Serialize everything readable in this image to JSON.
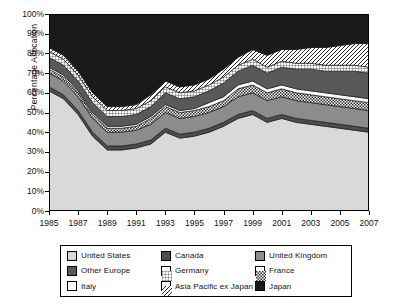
{
  "chart_data": {
    "type": "area",
    "title": "",
    "xlabel": "",
    "ylabel": "Percentage Allocation",
    "ylim": [
      0,
      100
    ],
    "xlim": [
      1985,
      2007
    ],
    "grid": false,
    "stacked": true,
    "normalized": true,
    "legend_position": "bottom",
    "ytick_labels": [
      "0%",
      "10%",
      "20%",
      "30%",
      "40%",
      "50%",
      "60%",
      "70%",
      "80%",
      "90%",
      "100%"
    ],
    "ytick_values": [
      0,
      10,
      20,
      30,
      40,
      50,
      60,
      70,
      80,
      90,
      100
    ],
    "xtick_labels": [
      "1985",
      "1987",
      "1989",
      "1991",
      "1993",
      "1995",
      "1997",
      "1999",
      "2001",
      "2003",
      "2005",
      "2007"
    ],
    "xtick_values": [
      1985,
      1987,
      1989,
      1991,
      1993,
      1995,
      1997,
      1999,
      2001,
      2003,
      2005,
      2007
    ],
    "x": [
      1985,
      1986,
      1987,
      1988,
      1989,
      1990,
      1991,
      1992,
      1993,
      1994,
      1995,
      1996,
      1997,
      1998,
      1999,
      2000,
      2001,
      2002,
      2003,
      2004,
      2005,
      2006,
      2007
    ],
    "series": [
      {
        "name": "United States",
        "fill": "#d9d9d9",
        "pattern": "solid",
        "values": [
          61,
          57,
          49,
          38,
          31,
          31,
          32,
          34,
          40,
          37,
          38,
          40,
          43,
          47,
          49,
          45,
          47,
          45,
          44,
          43,
          42,
          41,
          40
        ]
      },
      {
        "name": "Canada",
        "fill": "#4d4d4d",
        "pattern": "solid",
        "values": [
          2,
          2,
          2,
          2,
          2,
          2,
          2,
          2,
          2,
          2,
          2,
          2,
          2,
          2,
          2,
          2,
          2,
          2,
          2,
          2,
          2,
          2,
          2
        ]
      },
      {
        "name": "United Kingdom",
        "fill": "#8c8c8c",
        "pattern": "solid",
        "values": [
          7,
          7,
          7,
          7,
          7,
          7,
          7,
          8,
          8,
          8,
          8,
          8,
          8,
          9,
          9,
          9,
          9,
          9,
          9,
          9,
          9,
          9,
          9
        ]
      },
      {
        "name": "France",
        "fill": "#ffffff",
        "pattern": "checker",
        "values": [
          2,
          2,
          2,
          2,
          2,
          2,
          2,
          3,
          3,
          3,
          3,
          3,
          3,
          4,
          4,
          4,
          4,
          4,
          4,
          4,
          4,
          4,
          4
        ]
      },
      {
        "name": "Italy",
        "fill": "#ffffff",
        "pattern": "solid",
        "values": [
          1,
          1,
          1,
          1,
          1,
          1,
          1,
          1,
          1,
          1,
          1,
          2,
          2,
          2,
          2,
          2,
          2,
          2,
          2,
          2,
          2,
          2,
          2
        ]
      },
      {
        "name": "Other Europe",
        "fill": "#595959",
        "pattern": "solid",
        "values": [
          5,
          5,
          5,
          5,
          5,
          5,
          5,
          5,
          6,
          6,
          6,
          6,
          7,
          7,
          8,
          8,
          9,
          10,
          11,
          11,
          12,
          13,
          13
        ]
      },
      {
        "name": "Germany",
        "fill": "#ffffff",
        "pattern": "grid",
        "values": [
          3,
          3,
          3,
          3,
          3,
          3,
          3,
          3,
          3,
          3,
          3,
          3,
          3,
          3,
          3,
          3,
          3,
          3,
          3,
          3,
          3,
          3,
          3
        ]
      },
      {
        "name": "Asia Pacific ex Japan",
        "fill": "#ffffff",
        "pattern": "diagonal",
        "values": [
          2,
          2,
          2,
          2,
          2,
          2,
          2,
          3,
          3,
          3,
          3,
          3,
          4,
          4,
          5,
          6,
          6,
          7,
          8,
          9,
          10,
          11,
          12
        ]
      },
      {
        "name": "Japan",
        "fill": "#1a1a1a",
        "pattern": "solid",
        "values": [
          17,
          21,
          29,
          40,
          47,
          47,
          46,
          42,
          35,
          37,
          36,
          33,
          28,
          22,
          18,
          21,
          18,
          18,
          17,
          17,
          16,
          15,
          15
        ]
      }
    ]
  },
  "legend": {
    "items": [
      {
        "label": "United States"
      },
      {
        "label": "Canada"
      },
      {
        "label": "United Kingdom"
      },
      {
        "label": "Germany"
      },
      {
        "label": "France"
      },
      {
        "label": "Italy"
      },
      {
        "label": "Other Europe"
      },
      {
        "label": "Asia Pacific ex Japan"
      },
      {
        "label": "Japan"
      }
    ],
    "order": [
      0,
      1,
      2,
      6,
      3,
      4,
      5,
      7,
      8
    ]
  }
}
